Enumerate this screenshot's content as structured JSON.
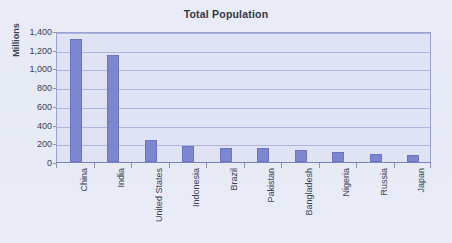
{
  "chart_data": {
    "type": "bar",
    "title": "Total Population",
    "xlabel": "",
    "ylabel": "Millions",
    "ylim": [
      0,
      1400
    ],
    "yticks": [
      0,
      200,
      400,
      600,
      800,
      1000,
      1200,
      1400
    ],
    "ytick_labels": [
      "0",
      "200",
      "400",
      "600",
      "800",
      "1,000",
      "1,200",
      "1,400"
    ],
    "grid": true,
    "legend": "none",
    "categories": [
      "China",
      "India",
      "United States",
      "Indonesia",
      "Brazil",
      "Pakistan",
      "Bangladesh",
      "Nigeria",
      "Russia",
      "Japan"
    ],
    "values": [
      1310,
      1140,
      235,
      170,
      155,
      150,
      130,
      105,
      85,
      70
    ],
    "series": [
      {
        "name": "Total Population",
        "values": [
          1310,
          1140,
          235,
          170,
          155,
          150,
          130,
          105,
          85,
          70
        ]
      }
    ]
  },
  "colors": {
    "bar_fill": "#7d87cf",
    "bar_border": "#6a74c0",
    "plot_background": "#dfe3f3",
    "page_background": "#e8ebf6",
    "gridline": "#aeb5dd",
    "axis_line": "#7b84c3",
    "text": "#3b3f52",
    "title_text": "#333645"
  }
}
